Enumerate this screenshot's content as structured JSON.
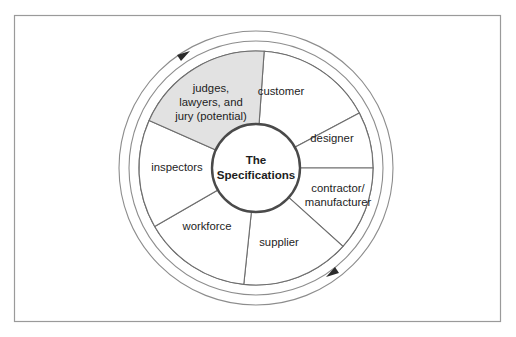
{
  "figure": {
    "hub": {
      "line1": "The",
      "line2": "Specifications"
    },
    "frame": {
      "border_color": "#9a9a9a"
    },
    "colors": {
      "highlight_fill": "#e2e2e2",
      "segment_fill": "#ffffff",
      "stroke": "#6e6e6e",
      "hub_stroke": "#4a4a4a",
      "text": "#1d1d1d"
    },
    "rotation": {
      "direction": "clockwise",
      "arrow_count": 2
    },
    "segments": [
      {
        "id": "customer",
        "label": "customer",
        "lines": [
          "customer"
        ],
        "highlighted": false,
        "start_angle": -86,
        "end_angle": -28,
        "label_x": 281,
        "label_y": 92
      },
      {
        "id": "designer",
        "label": "designer",
        "lines": [
          "designer"
        ],
        "highlighted": false,
        "start_angle": -28,
        "end_angle": 0,
        "label_x": 332,
        "label_y": 139
      },
      {
        "id": "contractor-manufacturer",
        "label": "contractor/ manufacturer",
        "lines": [
          "contractor/",
          "manufacturer"
        ],
        "highlighted": false,
        "start_angle": 0,
        "end_angle": 42,
        "label_x": 338,
        "label_y": 196
      },
      {
        "id": "supplier",
        "label": "supplier",
        "lines": [
          "supplier"
        ],
        "highlighted": false,
        "start_angle": 42,
        "end_angle": 96,
        "label_x": 279,
        "label_y": 243
      },
      {
        "id": "workforce",
        "label": "workforce",
        "lines": [
          "workforce"
        ],
        "highlighted": false,
        "start_angle": 96,
        "end_angle": 150,
        "label_x": 207,
        "label_y": 227
      },
      {
        "id": "inspectors",
        "label": "inspectors",
        "lines": [
          "inspectors"
        ],
        "highlighted": false,
        "start_angle": 150,
        "end_angle": 204,
        "label_x": 177,
        "label_y": 168
      },
      {
        "id": "judges-lawyers-jury",
        "label": "judges, lawyers, and jury (potential)",
        "lines": [
          "judges,",
          "lawyers, and",
          "jury (potential)"
        ],
        "highlighted": true,
        "start_angle": 204,
        "end_angle": 274,
        "label_x": 211,
        "label_y": 103
      }
    ]
  }
}
